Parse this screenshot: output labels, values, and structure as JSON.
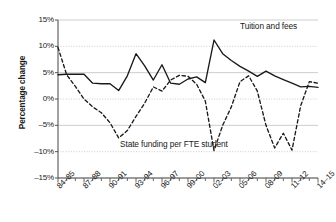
{
  "chart_data": {
    "type": "line",
    "title": "",
    "xlabel": "",
    "ylabel": "Percentage change",
    "ylim": [
      -15,
      15
    ],
    "ytick_labels": [
      "15%",
      "10%",
      "5%",
      "0%",
      "–5%",
      "–10%",
      "–15%"
    ],
    "ytick_values": [
      15,
      10,
      5,
      0,
      -5,
      -10,
      -15
    ],
    "grid": true,
    "legend_position": "inline-annotations",
    "x": [
      "84–85",
      "85–86",
      "86–87",
      "87–88",
      "88–89",
      "89–90",
      "90–91",
      "91–92",
      "92–93",
      "93–94",
      "94–95",
      "95–96",
      "96–97",
      "97–98",
      "98–99",
      "99–00",
      "00–01",
      "01–02",
      "02–03",
      "03–04",
      "04–05",
      "05–06",
      "06–07",
      "07–08",
      "08–09",
      "09–10",
      "10–11",
      "11–12",
      "12–13",
      "13–14",
      "14–15"
    ],
    "xtick_labels": [
      "84–85",
      "87–88",
      "90–91",
      "93–94",
      "96–97",
      "99–00",
      "02–03",
      "05–06",
      "08–09",
      "11–12",
      "14–15"
    ],
    "xtick_indices": [
      0,
      3,
      6,
      9,
      12,
      15,
      18,
      21,
      24,
      27,
      30
    ],
    "series": [
      {
        "name": "Tuition and fees",
        "style": "solid",
        "color": "#1a1a1a",
        "values": [
          4.6,
          4.7,
          4.7,
          4.7,
          3.0,
          2.9,
          2.9,
          1.6,
          4.4,
          8.6,
          6.3,
          3.6,
          6.5,
          3.0,
          2.8,
          3.8,
          4.2,
          3.1,
          11.2,
          8.6,
          7.3,
          6.2,
          5.3,
          4.3,
          5.3,
          4.4,
          3.7,
          3.0,
          2.3,
          2.4,
          2.2
        ]
      },
      {
        "name": "State funding per FTE student",
        "style": "dashed",
        "color": "#1a1a1a",
        "values": [
          9.8,
          4.6,
          2.4,
          0.0,
          -1.5,
          -2.6,
          -4.5,
          -7.4,
          -6.0,
          -3.3,
          -0.8,
          2.3,
          1.5,
          3.6,
          4.5,
          4.3,
          2.8,
          -0.4,
          -9.8,
          -5.0,
          -1.5,
          3.3,
          4.4,
          1.5,
          -5.0,
          -9.3,
          -6.5,
          -9.7,
          -1.3,
          3.3,
          3.0
        ]
      }
    ],
    "annotations": [
      {
        "text": "Tuition and fees",
        "series": "Tuition and fees"
      },
      {
        "text": "State funding per FTE student",
        "series": "State funding per FTE student"
      }
    ]
  }
}
